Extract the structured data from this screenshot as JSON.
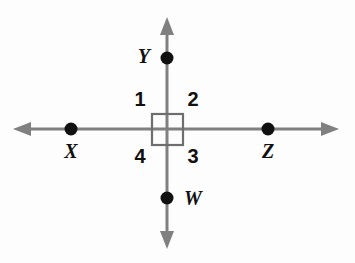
{
  "diagram": {
    "type": "geometry-intersecting-lines",
    "background_color": "#fdfdfd",
    "line_color": "#808080",
    "label_color": "#111111",
    "point_color": "#111111",
    "right_angle_box_color": "#6e6e6e",
    "points": [
      {
        "id": "Y",
        "label": "Y",
        "cx": 167,
        "cy": 58,
        "label_x": 150,
        "label_y": 58,
        "anchor": "end"
      },
      {
        "id": "X",
        "label": "X",
        "cx": 71,
        "cy": 129,
        "label_x": 71,
        "label_y": 153,
        "anchor": "middle"
      },
      {
        "id": "Z",
        "label": "Z",
        "cx": 268,
        "cy": 129,
        "label_x": 268,
        "label_y": 153,
        "anchor": "middle"
      },
      {
        "id": "W",
        "label": "W",
        "cx": 167,
        "cy": 198,
        "label_x": 184,
        "label_y": 200,
        "anchor": "start"
      }
    ],
    "angle_labels": [
      {
        "id": "angle-1",
        "label": "1",
        "x": 140,
        "y": 101
      },
      {
        "id": "angle-2",
        "label": "2",
        "x": 193,
        "y": 101
      },
      {
        "id": "angle-3",
        "label": "3",
        "x": 193,
        "y": 158
      },
      {
        "id": "angle-4",
        "label": "4",
        "x": 140,
        "y": 158
      }
    ],
    "intersection": {
      "x": 167,
      "y": 129
    },
    "right_angle_box": {
      "x": 152,
      "y": 114,
      "width": 31,
      "height": 31
    },
    "horizontal_line": {
      "x1": 20,
      "y1": 129,
      "x2": 332,
      "y2": 129
    },
    "vertical_line": {
      "x1": 167,
      "y1": 24,
      "x2": 167,
      "y2": 242
    },
    "arrow_tips": {
      "left": {
        "x": 13,
        "y": 129
      },
      "right": {
        "x": 339,
        "y": 129
      },
      "up": {
        "x": 167,
        "y": 17
      },
      "down": {
        "x": 167,
        "y": 249
      }
    }
  }
}
